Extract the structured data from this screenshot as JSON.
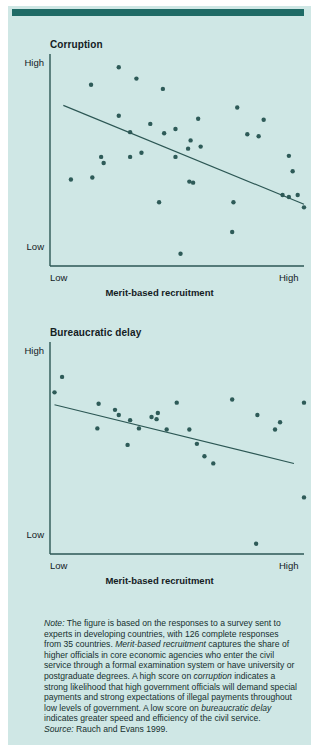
{
  "figure": {
    "background_color": "#cfe7e5",
    "rule_color": "#1f6b66",
    "ink_color": "#2c5754",
    "dot_color": "#2e5b58"
  },
  "panels": [
    {
      "id": "corruption",
      "title": "Corruption",
      "y_high_label": "High",
      "y_low_label": "Low",
      "x_low_label": "Low",
      "x_high_label": "High",
      "x_axis_title": "Merit-based recruitment"
    },
    {
      "id": "bureaucratic-delay",
      "title": "Bureaucratic delay",
      "y_high_label": "High",
      "y_low_label": "Low",
      "x_low_label": "Low",
      "x_high_label": "High",
      "x_axis_title": "Merit-based recruitment"
    }
  ],
  "note": {
    "label": "Note:",
    "body": " The figure is based on the responses to a survey sent to experts in developing countries, with 126 complete responses from 35 countries. ",
    "term1": "Merit-based recruitment",
    "body2": " captures the share of higher officials in core economic agencies who enter the civil service through a formal examination system or have university or postgraduate degrees. A high score on ",
    "term2": "corruption",
    "body3": " indicates a strong likelihood that high government officials will demand special payments and strong expectations of illegal payments throughout low levels of government. A low score on ",
    "term3": "bureaucratic delay",
    "body4": " indicates greater speed and efficiency of the civil service.",
    "source_label": "Source:",
    "source_text": " Rauch and Evans 1999."
  },
  "chart_data": [
    {
      "type": "scatter",
      "title": "Corruption",
      "xlabel": "Merit-based recruitment",
      "ylabel": "Corruption",
      "xlim": [
        0,
        1
      ],
      "ylim": [
        0,
        1
      ],
      "xticklabels": [
        "Low",
        "High"
      ],
      "yticklabels": [
        "Low",
        "High"
      ],
      "grid": false,
      "legend": "none",
      "points": [
        [
          0.265,
          0.955
        ],
        [
          0.335,
          0.9
        ],
        [
          0.155,
          0.87
        ],
        [
          0.44,
          0.85
        ],
        [
          0.735,
          0.76
        ],
        [
          0.265,
          0.72
        ],
        [
          0.84,
          0.7
        ],
        [
          0.58,
          0.705
        ],
        [
          0.39,
          0.68
        ],
        [
          0.49,
          0.655
        ],
        [
          0.31,
          0.64
        ],
        [
          0.445,
          0.635
        ],
        [
          0.775,
          0.63
        ],
        [
          0.82,
          0.62
        ],
        [
          0.55,
          0.6
        ],
        [
          0.54,
          0.56
        ],
        [
          0.59,
          0.57
        ],
        [
          0.355,
          0.54
        ],
        [
          0.31,
          0.52
        ],
        [
          0.49,
          0.52
        ],
        [
          0.195,
          0.52
        ],
        [
          0.205,
          0.49
        ],
        [
          0.94,
          0.525
        ],
        [
          0.16,
          0.42
        ],
        [
          0.955,
          0.45
        ],
        [
          0.075,
          0.41
        ],
        [
          0.545,
          0.4
        ],
        [
          0.56,
          0.395
        ],
        [
          0.915,
          0.335
        ],
        [
          0.94,
          0.325
        ],
        [
          0.975,
          0.335
        ],
        [
          0.72,
          0.3
        ],
        [
          0.425,
          0.3
        ],
        [
          1.0,
          0.275
        ],
        [
          0.715,
          0.155
        ],
        [
          0.51,
          0.05
        ]
      ],
      "trendline": {
        "x0": 0.045,
        "y0": 0.77,
        "x1": 1.0,
        "y1": 0.29
      }
    },
    {
      "type": "scatter",
      "title": "Bureaucratic delay",
      "xlabel": "Merit-based recruitment",
      "ylabel": "Bureaucratic delay",
      "xlim": [
        0,
        1
      ],
      "ylim": [
        0,
        1
      ],
      "xticklabels": [
        "Low",
        "High"
      ],
      "yticklabels": [
        "Low",
        "High"
      ],
      "grid": false,
      "legend": "none",
      "points": [
        [
          0.04,
          0.85
        ],
        [
          0.01,
          0.775
        ],
        [
          0.185,
          0.72
        ],
        [
          0.495,
          0.725
        ],
        [
          0.715,
          0.74
        ],
        [
          1.0,
          0.725
        ],
        [
          0.25,
          0.69
        ],
        [
          0.42,
          0.675
        ],
        [
          0.395,
          0.655
        ],
        [
          0.265,
          0.665
        ],
        [
          0.815,
          0.665
        ],
        [
          0.31,
          0.64
        ],
        [
          0.415,
          0.645
        ],
        [
          0.905,
          0.63
        ],
        [
          0.18,
          0.6
        ],
        [
          0.345,
          0.6
        ],
        [
          0.455,
          0.595
        ],
        [
          0.545,
          0.595
        ],
        [
          0.885,
          0.595
        ],
        [
          0.3,
          0.52
        ],
        [
          0.575,
          0.525
        ],
        [
          0.605,
          0.465
        ],
        [
          0.64,
          0.43
        ],
        [
          1.0,
          0.265
        ],
        [
          0.81,
          0.04
        ]
      ],
      "trendline": {
        "x0": 0.01,
        "y0": 0.715,
        "x1": 0.96,
        "y1": 0.43
      }
    }
  ]
}
